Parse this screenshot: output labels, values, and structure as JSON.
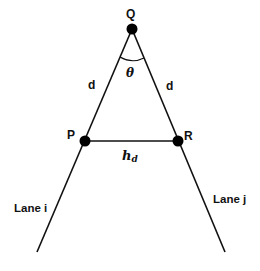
{
  "diagram": {
    "points": {
      "Q": {
        "label": "Q",
        "x": 132,
        "y": 29
      },
      "P": {
        "label": "P",
        "x": 85,
        "y": 141
      },
      "R": {
        "label": "R",
        "x": 178,
        "y": 141
      }
    },
    "lanes": {
      "left": {
        "label": "Lane i",
        "end_x": 37,
        "end_y": 252
      },
      "right": {
        "label": "Lane j",
        "end_x": 225,
        "end_y": 252
      }
    },
    "edges": {
      "QP": {
        "label": "d"
      },
      "QR": {
        "label": "d"
      },
      "PR": {
        "label": "h",
        "subscript": "d"
      }
    },
    "angle": {
      "label": "θ"
    },
    "colors": {
      "line": "#111111",
      "point": "#000000",
      "background": "#ffffff"
    }
  }
}
